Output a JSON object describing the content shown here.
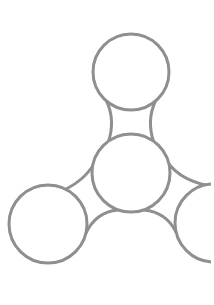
{
  "figure": {
    "background": "#ffffff",
    "stroke_color": "#8f8f8f",
    "stroke_width": 3
  },
  "shapes": {
    "circles": [
      {
        "name": "top-lobe",
        "cx": 131,
        "cy": 72,
        "r": 38
      },
      {
        "name": "center-hub",
        "cx": 131,
        "cy": 173,
        "r": 39
      },
      {
        "name": "left-lobe",
        "cx": 48,
        "cy": 224,
        "r": 39
      },
      {
        "name": "right-lobe",
        "cx": 214,
        "cy": 223,
        "r": 39
      }
    ]
  }
}
